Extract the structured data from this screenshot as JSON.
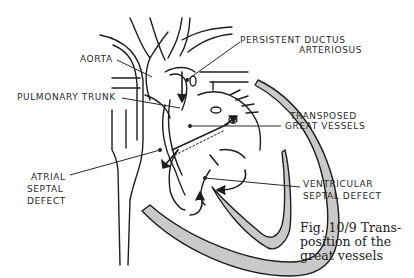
{
  "labels": {
    "aorta": "AORTA",
    "pulmonary_trunk": "PULMONARY TRUNK",
    "persistent_ductus_line1": "PERSISTENT DUCTUS",
    "persistent_ductus_line2": "ARTERIOSUS",
    "transposed_line1": "TRANSPOSED",
    "transposed_line2": "GREAT VESSELS",
    "atrial_line1": "ATRIAL",
    "atrial_line2": "SEPTAL",
    "atrial_line3": "DEFECT",
    "ventricular_line1": "VENTRICULAR",
    "ventricular_line2": "SEPTAL DEFECT"
  },
  "caption": {
    "line1": "Fig. 10/9   Trans-",
    "line2": "position of the",
    "line3": "great vessels"
  },
  "colors": {
    "stroke": "#1e1e1e",
    "wall_fill": "#c9c9c9",
    "background": "#ffffff"
  }
}
